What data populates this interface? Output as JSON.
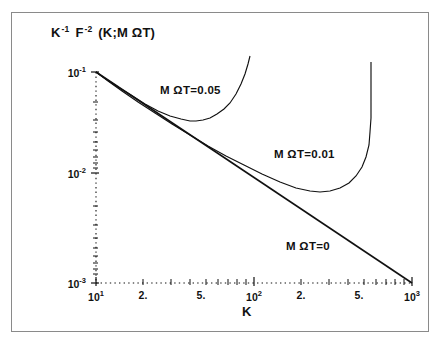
{
  "figure": {
    "ylabel_title": "K -1 F -2 (K;M ΩT)",
    "ylabel_parts": {
      "k": "K",
      "k_sup": "-1",
      "f": "F",
      "f_sup": "-2",
      "args": "(K;M ΩT)"
    },
    "xaxis_title": "K"
  },
  "chart_data": {
    "type": "line",
    "xlabel": "K",
    "ylabel": "K -1 F -2 (K;M ΩT)",
    "xscale": "log",
    "yscale": "log",
    "xlim": [
      10,
      1000
    ],
    "ylim": [
      0.001,
      0.1
    ],
    "grid": false,
    "legend_position": "inline-annotations",
    "x_ticks": [
      {
        "value": 10,
        "label": "10",
        "sup": "1"
      },
      {
        "value": 20,
        "label": "2.",
        "sup": ""
      },
      {
        "value": 50,
        "label": "5.",
        "sup": ""
      },
      {
        "value": 100,
        "label": "10",
        "sup": "2"
      },
      {
        "value": 200,
        "label": "2.",
        "sup": ""
      },
      {
        "value": 500,
        "label": "5.",
        "sup": ""
      },
      {
        "value": 1000,
        "label": "10",
        "sup": "3"
      }
    ],
    "y_ticks": [
      {
        "value": 0.1,
        "label": "10",
        "sup": "-1"
      },
      {
        "value": 0.01,
        "label": "10",
        "sup": "-2"
      },
      {
        "value": 0.001,
        "label": "10",
        "sup": "-3"
      }
    ],
    "series": [
      {
        "name": "M ΩT=0.05",
        "annotation": "M ΩT=0.05",
        "annotation_x": 160,
        "annotation_y": 84,
        "points_px": "96,72 106,79 118,87 131,95 145,104 158,111 170,116 181,119 190,121 196,121 203,120 210,118 217,114 224,109 230,103 236,94 241,84 245,74 248,64 250,56"
      },
      {
        "name": "M ΩT=0.01",
        "annotation": "M ΩT=0.01",
        "annotation_x": 274,
        "annotation_y": 148,
        "points_px": "96,72 108,81 122,91 138,102 155,113 172,124 190,135 208,146 226,156 244,165 262,174 280,182 296,188 310,191 320,192 330,191 340,188 349,183 356,176 362,167 366,157 369,145 370,132 371,118 371,104 371,90 371,76 371,62"
      },
      {
        "name": "M ΩT=0",
        "annotation": "M ΩT=0",
        "annotation_x": 286,
        "annotation_y": 240,
        "points_px": "96,72 412,283"
      }
    ]
  }
}
